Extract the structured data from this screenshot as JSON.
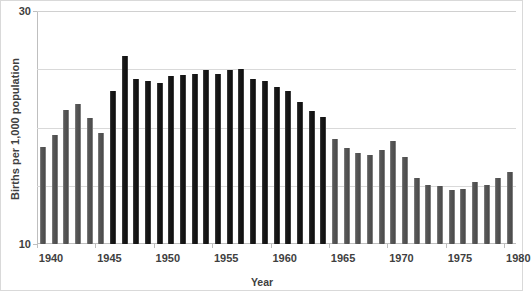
{
  "chart_data": {
    "type": "bar",
    "title": "",
    "xlabel": "Year",
    "ylabel": "Births per 1,000 population",
    "xlim": [
      1939.5,
      1980.5
    ],
    "ylim": [
      10,
      30
    ],
    "ytick_labels": [
      "30",
      "10"
    ],
    "ytick_values": [
      30,
      10
    ],
    "gridline_values": [
      30,
      25,
      20,
      15,
      10
    ],
    "grid": true,
    "legend": "none",
    "xtick_labels": [
      "1940",
      "1945",
      "1950",
      "1955",
      "1960",
      "1965",
      "1970",
      "1975",
      "1980"
    ],
    "xtick_values": [
      1940,
      1945,
      1950,
      1955,
      1960,
      1965,
      1970,
      1975,
      1980
    ],
    "categories": [
      1940,
      1941,
      1942,
      1943,
      1944,
      1945,
      1946,
      1947,
      1948,
      1949,
      1950,
      1951,
      1952,
      1953,
      1954,
      1955,
      1956,
      1957,
      1958,
      1959,
      1960,
      1961,
      1962,
      1963,
      1964,
      1965,
      1966,
      1967,
      1968,
      1969,
      1970,
      1971,
      1972,
      1973,
      1974,
      1975,
      1976,
      1977,
      1978,
      1979,
      1980
    ],
    "values": [
      18.3,
      19.4,
      21.5,
      22.0,
      20.8,
      19.5,
      23.1,
      26.1,
      24.2,
      24.0,
      23.8,
      24.4,
      24.5,
      24.6,
      24.9,
      24.6,
      24.9,
      25.0,
      24.2,
      24.0,
      23.5,
      23.1,
      22.2,
      21.4,
      20.9,
      19.0,
      18.2,
      17.8,
      17.6,
      18.1,
      18.8,
      17.5,
      15.7,
      15.1,
      15.0,
      14.6,
      14.7,
      15.3,
      15.1,
      15.7,
      16.2
    ],
    "series": [
      {
        "name": "births-per-1000",
        "values": [
          18.3,
          19.4,
          21.5,
          22.0,
          20.8,
          19.5,
          23.1,
          26.1,
          24.2,
          24.0,
          23.8,
          24.4,
          24.5,
          24.6,
          24.9,
          24.6,
          24.9,
          25.0,
          24.2,
          24.0,
          23.5,
          23.1,
          22.2,
          21.4,
          20.9,
          19.0,
          18.2,
          17.8,
          17.6,
          18.1,
          18.8,
          17.5,
          15.7,
          15.1,
          15.0,
          14.6,
          14.7,
          15.3,
          15.1,
          15.7,
          16.2
        ]
      }
    ],
    "highlight_range": [
      1946,
      1964
    ],
    "bar_colors": {
      "default": "#595959",
      "highlight": "#1a1a1a"
    },
    "colors": {
      "grid": "#d9d9d9",
      "axis": "#bfbfbf",
      "text": "#3f3f3f",
      "background": "#ffffff",
      "frame": "#d9d9d9"
    }
  }
}
